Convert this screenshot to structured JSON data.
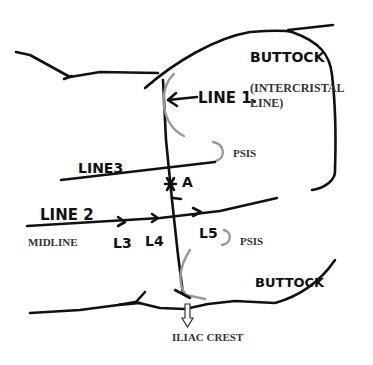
{
  "diagram": {
    "labels": {
      "buttock_top": "BUTTOCK",
      "buttock_bottom": "BUTTOCK",
      "line1": "LINE 1.",
      "line1_desc_1": "(INTERCRISTAL",
      "line1_desc_2": "LINE)",
      "line2": "LINE 2",
      "line3": "LINE3",
      "midline": "MIDLINE",
      "point_a": "A",
      "psis_upper": "PSIS",
      "psis_lower": "PSIS",
      "l3": "L3",
      "l4": "L4",
      "l5": "L5",
      "iliac_crest": "ILIAC CREST"
    },
    "colors": {
      "ink": "#111111",
      "bony_outline": "#999999",
      "printed_text": "#333333"
    }
  }
}
